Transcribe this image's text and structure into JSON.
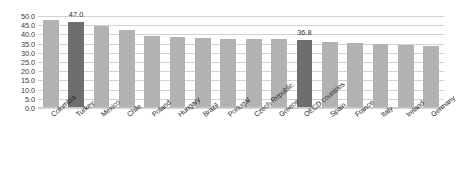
{
  "chart_data": {
    "type": "bar",
    "title": "",
    "xlabel": "",
    "ylabel": "",
    "ylim": [
      0,
      50
    ],
    "grid": true,
    "legend": false,
    "y_ticks": [
      "0.0",
      "5.0",
      "10.0",
      "15.0",
      "20.0",
      "25.0",
      "30.0",
      "35.0",
      "40.0",
      "45.0",
      "50.0"
    ],
    "categories": [
      "Colombia",
      "Turkey",
      "Mexico",
      "Chile",
      "Poland",
      "Hungary",
      "Brazil",
      "Portugal",
      "Czech Republic",
      "Greece",
      "OECD countries",
      "Spain",
      "France",
      "Italy",
      "Ireland",
      "Germany"
    ],
    "values": [
      48.0,
      47.0,
      44.5,
      42.5,
      39.0,
      38.5,
      38.0,
      37.5,
      37.5,
      37.3,
      36.8,
      36.0,
      35.5,
      34.8,
      34.3,
      33.5
    ],
    "highlighted": [
      "Turkey",
      "OECD countries"
    ],
    "data_labels": [
      {
        "category": "Turkey",
        "text": "47.0"
      },
      {
        "category": "OECD countries",
        "text": "36.8"
      }
    ],
    "colors": {
      "bar": "#b2b2b2",
      "bar_highlight": "#6e6e6e",
      "gridline": "#d2d2d2",
      "text": "#2b2b2b",
      "background": "#ffffff"
    }
  }
}
